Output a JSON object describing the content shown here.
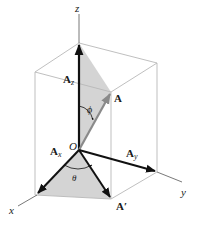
{
  "diagram": {
    "type": "3d-vector-components",
    "axes": {
      "x_label": "x",
      "y_label": "y",
      "z_label": "z",
      "origin_label": "O"
    },
    "vectors": {
      "A": {
        "label": "A"
      },
      "Ax": {
        "label": "A",
        "subscript": "x"
      },
      "Ay": {
        "label": "A",
        "subscript": "y"
      },
      "Az": {
        "label": "A",
        "subscript": "z"
      },
      "A_prime": {
        "label": "A′"
      }
    },
    "angles": {
      "phi": "ϕ",
      "theta": "θ"
    },
    "colors": {
      "box_edge": "#b8b8b8",
      "axis": "#555555",
      "vector": "#111111",
      "vector_A": "#8a8a8a",
      "shade": "#d4d4d4"
    }
  }
}
